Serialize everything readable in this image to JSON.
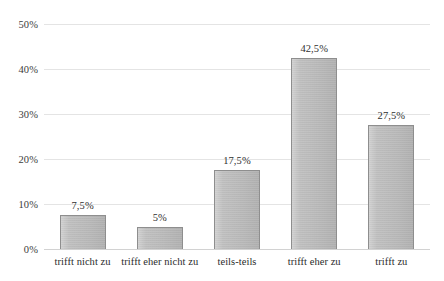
{
  "chart_data": {
    "type": "bar",
    "title": "",
    "subtitle": "",
    "xlabel": "",
    "ylabel": "",
    "categories": [
      "trifft nicht zu",
      "trifft eher nicht zu",
      "teils-teils",
      "trifft eher zu",
      "trifft zu"
    ],
    "values": [
      7.5,
      5,
      17.5,
      42.5,
      27.5
    ],
    "value_labels": [
      "7,5%",
      "5%",
      "17,5%",
      "42,5%",
      "27,5%"
    ],
    "ylim": [
      0,
      50
    ],
    "ytick_values": [
      0,
      10,
      20,
      30,
      40,
      50
    ],
    "ytick_labels": [
      "0%",
      "10%",
      "20%",
      "30%",
      "40%",
      "50%"
    ],
    "grid": true,
    "legend": false,
    "legend_position": "none",
    "series": [
      {
        "name": "",
        "values": [
          7.5,
          5,
          17.5,
          42.5,
          27.5
        ]
      }
    ],
    "colors": {
      "bar_fill": "#bfbfbf",
      "bar_border": "#8e8e8e",
      "gridline": "#e4e4e4",
      "baseline": "#d2d2d2",
      "text": "#2b2b2b",
      "background": "#ffffff"
    }
  }
}
